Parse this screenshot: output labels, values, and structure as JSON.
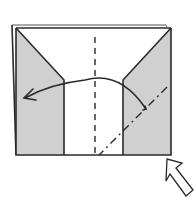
{
  "diagram": {
    "colors": {
      "paper_white": "#ffffff",
      "paper_shaded": "#d0d0d0",
      "line": "#2a2a2a"
    },
    "elements": {
      "paper_sheet": "Rectangular folded paper with layered back edge",
      "left_flap": "Shaded triangular/trapezoid flap on left side",
      "right_flap": "Shaded trapezoid flap on right side",
      "center_fold_line": "Vertical valley fold (dashed)",
      "diagonal_fold_line": "Diagonal mountain fold (dash-dot) on right flap",
      "fold_arrow": "Curved arrow from right to left indicating fold over",
      "push_arrow": "Hollow arrow at bottom-right indicating squash/push"
    }
  }
}
